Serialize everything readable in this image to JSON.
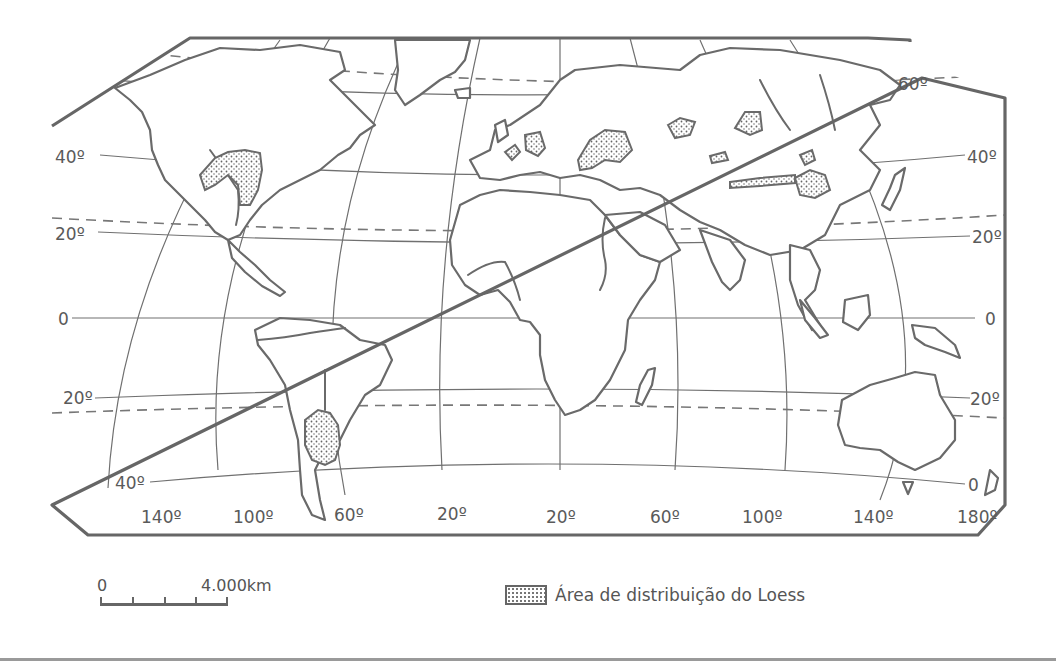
{
  "map": {
    "title": "",
    "projection": "Robinson-like world map",
    "colors": {
      "line": "#6a6a6a",
      "background": "#ffffff",
      "loess_fill": "dotted"
    },
    "parallel_labels": {
      "left": [
        {
          "id": "lat-40n-left",
          "text": "40º"
        },
        {
          "id": "lat-20n-left",
          "text": "20º"
        },
        {
          "id": "lat-0-left",
          "text": "0"
        },
        {
          "id": "lat-20s-left",
          "text": "20º"
        },
        {
          "id": "lat-40s-left",
          "text": "40º"
        }
      ],
      "right": [
        {
          "id": "lat-60n-right",
          "text": "60º"
        },
        {
          "id": "lat-40n-right",
          "text": "40º"
        },
        {
          "id": "lat-20n-right",
          "text": "20º"
        },
        {
          "id": "lat-0-right",
          "text": "0"
        },
        {
          "id": "lat-20s-right",
          "text": "20º"
        },
        {
          "id": "lat-40s-right",
          "text": "0"
        }
      ]
    },
    "meridian_labels": [
      {
        "id": "lon-140w",
        "text": "140º"
      },
      {
        "id": "lon-100w",
        "text": "100º"
      },
      {
        "id": "lon-60w",
        "text": "60º"
      },
      {
        "id": "lon-20w",
        "text": "20º"
      },
      {
        "id": "lon-20e",
        "text": "20º"
      },
      {
        "id": "lon-60e",
        "text": "60º"
      },
      {
        "id": "lon-100e",
        "text": "100º"
      },
      {
        "id": "lon-140e",
        "text": "140º"
      },
      {
        "id": "lon-180",
        "text": "180º"
      }
    ],
    "loess_regions": [
      "North America (Mississippi–Missouri basin)",
      "South America (Pampas / Argentina)",
      "Western Europe",
      "Central Europe",
      "Eastern Europe / Ukraine",
      "Central Asia",
      "Northern China",
      "Siberia / Russia"
    ]
  },
  "scale_bar": {
    "start_label": "0",
    "end_label": "4.000km"
  },
  "legend": {
    "items": [
      {
        "symbol": "dotted-area",
        "label": "Área de distribuição do Loess"
      }
    ]
  }
}
